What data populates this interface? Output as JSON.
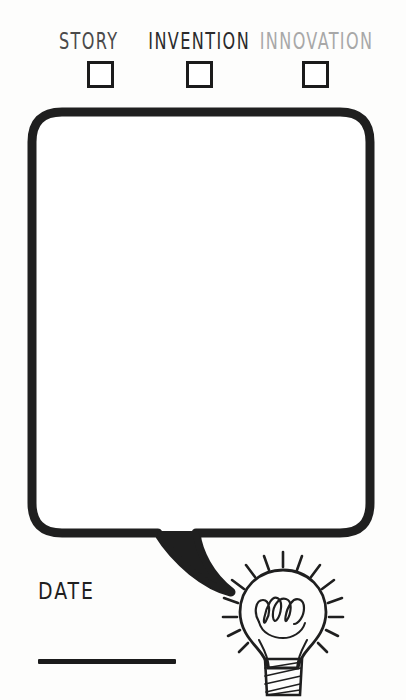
{
  "page": {
    "background_color": "#fdfdfc",
    "ink_color": "#1b1b1b"
  },
  "categories": {
    "items": [
      {
        "label": "STORY",
        "checked": false,
        "color": "#4a4a4a",
        "checkbox_name": "checkbox-story"
      },
      {
        "label": "INVENTION",
        "checked": false,
        "color": "#2b2b2b",
        "checkbox_name": "checkbox-invention"
      },
      {
        "label": "INNOVATION",
        "checked": false,
        "color": "#a8a8a8",
        "checkbox_name": "checkbox-innovation"
      }
    ]
  },
  "speech_bubble": {
    "content": "",
    "placeholder": "",
    "stroke_color": "#1b1b1b",
    "fill_color": "#ffffff"
  },
  "date_field": {
    "label": "DATE",
    "value": "",
    "rule_color": "#1b1b1b"
  },
  "lightbulb": {
    "icon_name": "lightbulb-icon",
    "ray_count": 14,
    "filament_loops": 4,
    "stroke_color": "#1f1f1f"
  }
}
